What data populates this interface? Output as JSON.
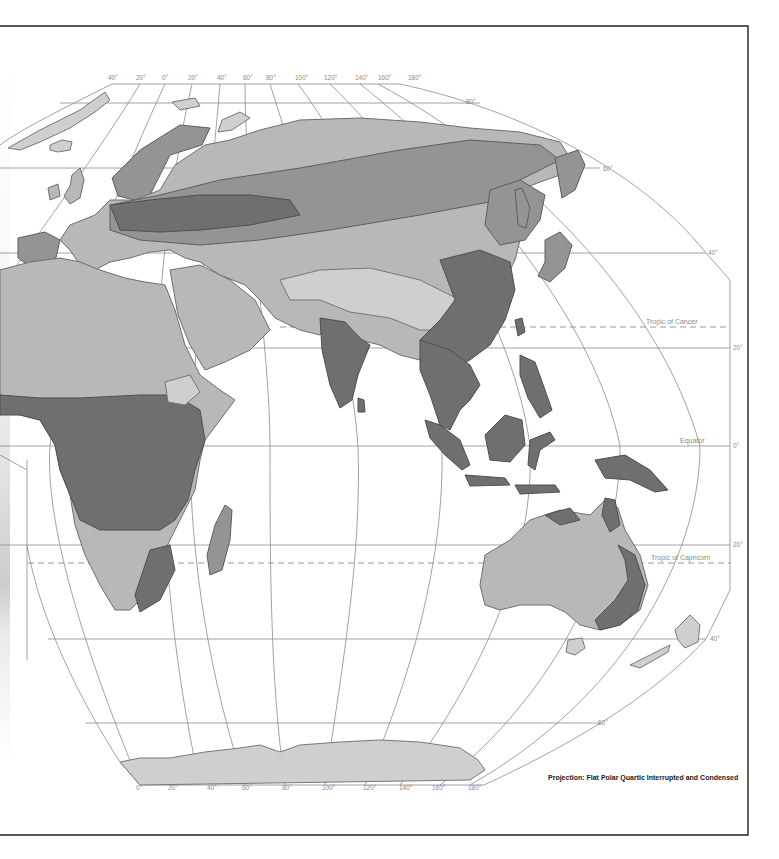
{
  "map": {
    "title": "Eastern Hemisphere Physical Relief Map",
    "projection_note": "Projection: Flat Polar Quartic Interrupted and Condensed",
    "top_longitude_labels": [
      "40°",
      "20°",
      "0°",
      "20°",
      "40°",
      "60°",
      "80°",
      "100°",
      "120°",
      "140°",
      "160°",
      "180°"
    ],
    "bottom_longitude_labels": [
      "0°",
      "20°",
      "40°",
      "60°",
      "80°",
      "100°",
      "120°",
      "140°",
      "160°",
      "180°"
    ],
    "latitude_labels": {
      "lat_80n": "80°",
      "lat_60n": "60°",
      "lat_40n": "40°",
      "lat_20n": "20°",
      "lat_0": "0°",
      "lat_20s": "20°",
      "lat_40s": "40°",
      "lat_60s": "60°"
    },
    "special_lines": {
      "tropic_cancer": "Tropic of Cancer",
      "equator": "Equator",
      "tropic_capricorn": "Tropic of Capricorn"
    },
    "regions": [
      "Europe",
      "Asia",
      "Africa",
      "Arabian Peninsula",
      "Indian Subcontinent",
      "Southeast Asia",
      "Australia",
      "New Zealand",
      "Madagascar",
      "Japan",
      "Antarctica",
      "Greenland (partial)",
      "Iceland"
    ],
    "colors": {
      "background": "#ffffff",
      "graticule": "#8a8a8a",
      "land_light": "#b8b8b8",
      "land_mid": "#949494",
      "land_dark": "#6f6f6f",
      "frame": "#222222"
    }
  }
}
